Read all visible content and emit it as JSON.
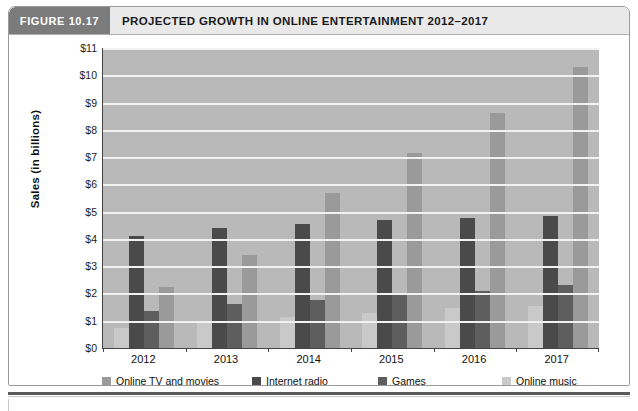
{
  "header": {
    "badge": "FIGURE 10.17",
    "title": "PROJECTED GROWTH IN ONLINE ENTERTAINMENT 2012–2017"
  },
  "chart_data": {
    "type": "bar",
    "title": "PROJECTED GROWTH IN ONLINE ENTERTAINMENT 2012–2017",
    "xlabel": "",
    "ylabel": "Sales (in billions)",
    "ylim": [
      0,
      11
    ],
    "ytick_labels": [
      "$11",
      "$10",
      "$9",
      "$8",
      "$7",
      "$6",
      "$5",
      "$4",
      "$3",
      "$2",
      "$1",
      "$0"
    ],
    "ytick_values": [
      11,
      10,
      9,
      8,
      7,
      6,
      5,
      4,
      3,
      2,
      1,
      0
    ],
    "grid": true,
    "legend_position": "bottom",
    "categories": [
      "2012",
      "2013",
      "2014",
      "2015",
      "2016",
      "2017"
    ],
    "series": [
      {
        "name": "Online TV and movies",
        "color": "#9a9a9a",
        "values": [
          2.25,
          3.4,
          5.7,
          7.15,
          8.6,
          10.3
        ]
      },
      {
        "name": "Internet radio",
        "color": "#4a4a4a",
        "values": [
          4.1,
          4.4,
          4.55,
          4.7,
          4.75,
          4.85
        ]
      },
      {
        "name": "Games",
        "color": "#5e5e5e",
        "values": [
          1.35,
          1.6,
          1.75,
          1.95,
          2.1,
          2.3
        ]
      },
      {
        "name": "Online music",
        "color": "#c9c9c9",
        "values": [
          0.75,
          0.95,
          1.15,
          1.3,
          1.45,
          1.55
        ]
      }
    ]
  }
}
